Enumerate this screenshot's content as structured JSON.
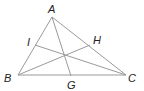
{
  "diagram": {
    "type": "triangle-with-cevians",
    "stroke_color": "#9a9a9a",
    "label_color": "#222222",
    "points": {
      "A": {
        "label": "A",
        "x": 52,
        "y": 17,
        "lx": 48,
        "ly": 13
      },
      "B": {
        "label": "B",
        "x": 18,
        "y": 75,
        "lx": 4,
        "ly": 82
      },
      "C": {
        "label": "C",
        "x": 126,
        "y": 75,
        "lx": 128,
        "ly": 82
      },
      "G": {
        "label": "G",
        "x": 71,
        "y": 76,
        "lx": 67,
        "ly": 89
      },
      "H": {
        "label": "H",
        "x": 90,
        "y": 45,
        "lx": 93,
        "ly": 44
      },
      "I": {
        "label": "I",
        "x": 35,
        "y": 45,
        "lx": 27,
        "ly": 46
      }
    },
    "segments": [
      [
        "A",
        "B"
      ],
      [
        "B",
        "C"
      ],
      [
        "C",
        "A"
      ],
      [
        "A",
        "G"
      ],
      [
        "B",
        "H"
      ],
      [
        "C",
        "I"
      ]
    ]
  }
}
